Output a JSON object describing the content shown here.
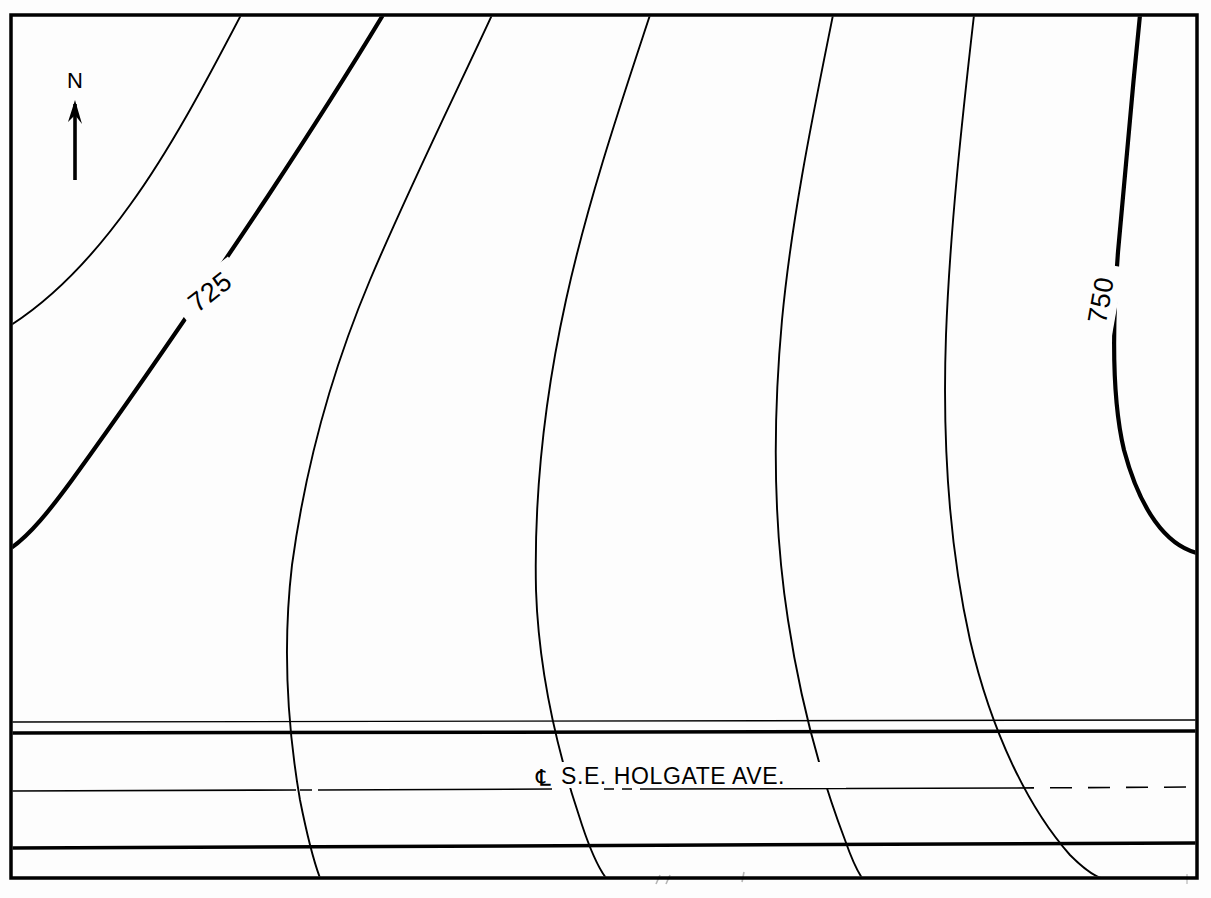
{
  "document": {
    "type": "engineering-contour-plan",
    "title": "S.E. HOLGATE AVE. Contour Plan",
    "background_color": "#fdfdfd",
    "ink_color": "#000000"
  },
  "frame": {
    "name": "drawing-border",
    "x": 11,
    "y": 15,
    "width": 1186,
    "height": 863,
    "stroke_width": 3.5
  },
  "north_arrow": {
    "label": "N",
    "x": 75,
    "y": 85,
    "tip_y": 100,
    "tail_y": 180,
    "stroke_width": 3.5
  },
  "contour_labels": [
    {
      "name": "contour-label-725",
      "text": "725",
      "x": 210,
      "y": 292,
      "rotation": -38,
      "elevation": 725
    },
    {
      "name": "contour-label-750",
      "text": "750",
      "x": 1101,
      "y": 300,
      "rotation": -80,
      "elevation": 750
    }
  ],
  "road": {
    "name": "s-e-holgate-ave",
    "label": "S.E. HOLGATE AVE.",
    "centerline_symbol": "℄",
    "label_x": 548,
    "label_y": 783,
    "edges": [
      {
        "name": "road-edge-north",
        "y_left": 733,
        "y_right": 731,
        "stroke_width": 3.5
      },
      {
        "name": "road-edge-south",
        "y_left": 848,
        "y_right": 843,
        "stroke_width": 3.5
      }
    ],
    "centerline": {
      "name": "road-centerline",
      "y_left": 791,
      "y_right": 787,
      "stroke_width": 1.6,
      "solid_segments": [
        [
          11,
          295
        ],
        [
          318,
          548
        ],
        [
          636,
          845
        ]
      ],
      "dashed_segments": [
        [
          845,
          1197
        ]
      ]
    },
    "shoulder_top": {
      "name": "road-shoulder-top",
      "y_left": 722,
      "y_right": 720,
      "stroke_width": 1.4
    }
  },
  "chart_data": {
    "type": "contour-map",
    "title": "S.E. HOLGATE AVE. Contour Plan",
    "contour_interval": 5,
    "units": "feet",
    "index_contours": [
      725,
      750
    ],
    "contours": [
      {
        "id": "c-1",
        "elevation": 715,
        "weight": "minor",
        "label": null,
        "path": "M 241,15 C 206,82 170,150 130,205 C 92,258 50,300 11,325"
      },
      {
        "id": "c-2",
        "elevation": 720,
        "weight": "minor",
        "label": null,
        "path": "M 383,15 C 345,78 305,140 268,196 C 212,280 130,400 72,480 C 50,510 30,535 11,548"
      },
      {
        "id": "c-3",
        "elevation": 725,
        "weight": "index",
        "label": "725",
        "path": "M 383,15 C 345,78 305,140 268,196 C 212,280 130,400 72,480 C 50,510 30,535 11,548"
      },
      {
        "id": "c-4",
        "elevation": 730,
        "weight": "minor",
        "label": null,
        "path": "M 492,15 C 455,95 408,190 370,280 C 330,375 305,470 292,565 C 282,650 288,730 300,800 C 308,840 314,862 320,878"
      },
      {
        "id": "c-5",
        "elevation": 735,
        "weight": "minor",
        "label": null,
        "path": "M 650,15 C 622,100 588,200 566,300 C 544,400 534,500 536,590 C 539,680 560,760 582,825 C 592,855 600,870 606,878"
      },
      {
        "id": "c-6",
        "elevation": 740,
        "weight": "minor",
        "label": null,
        "path": "M 833,15 C 814,110 792,215 782,320 C 772,430 774,530 788,620 C 802,712 826,790 845,840 C 852,860 858,872 862,878"
      },
      {
        "id": "c-7",
        "elevation": 745,
        "weight": "minor",
        "label": null,
        "path": "M 974,15 C 962,120 950,230 946,335 C 942,450 950,550 970,640 C 992,735 1030,810 1070,855 C 1085,870 1095,876 1101,878"
      },
      {
        "id": "c-8",
        "elevation": 750,
        "weight": "index",
        "label": "750",
        "path": "M 1140,15 C 1132,95 1124,180 1118,252 C 1112,330 1112,400 1124,450 C 1140,510 1166,545 1197,553"
      }
    ],
    "annotations": [
      {
        "type": "north-arrow",
        "label": "N"
      },
      {
        "type": "street-label",
        "label": "S.E. HOLGATE AVE.",
        "prefix": "℄"
      }
    ]
  }
}
